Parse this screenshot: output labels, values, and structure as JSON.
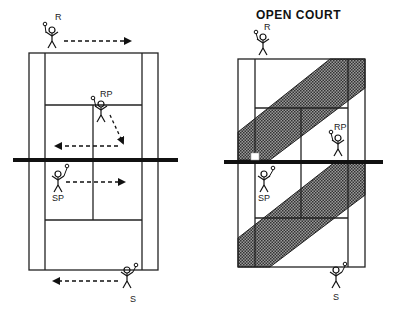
{
  "diagram": {
    "left_court": {
      "title": "",
      "players": [
        {
          "label": "R",
          "role": "receiver"
        },
        {
          "label": "RP",
          "role": "receiver-partner"
        },
        {
          "label": "SP",
          "role": "server-partner"
        },
        {
          "label": "S",
          "role": "server"
        }
      ],
      "arrows": [
        "R moves right",
        "RP moves down-right then left",
        "SP moves right",
        "S moves left"
      ]
    },
    "right_court": {
      "title": "OPEN COURT",
      "players": [
        {
          "label": "R",
          "role": "receiver"
        },
        {
          "label": "RP",
          "role": "receiver-partner"
        },
        {
          "label": "SP",
          "role": "server-partner"
        },
        {
          "label": "S",
          "role": "server"
        }
      ],
      "shaded_zones": [
        "upper diagonal open court band",
        "lower diagonal open court band"
      ]
    },
    "colors": {
      "line": "#222222",
      "shade": "#555555",
      "background": "#ffffff"
    }
  }
}
